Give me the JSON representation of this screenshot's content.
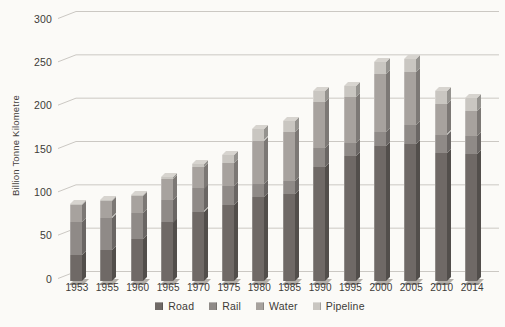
{
  "chart_data": {
    "type": "bar",
    "stacked": true,
    "style": "3d-column",
    "title": "",
    "ylabel": "Billion Tonne Kilometre",
    "xlabel": "",
    "ylim": [
      0,
      300
    ],
    "yticks": [
      0,
      50,
      100,
      150,
      200,
      250,
      300
    ],
    "grid": true,
    "legend_position": "bottom",
    "categories": [
      "1953",
      "1955",
      "1960",
      "1965",
      "1970",
      "1975",
      "1980",
      "1985",
      "1990",
      "1995",
      "2000",
      "2005",
      "2010",
      "2014"
    ],
    "series": [
      {
        "name": "Road",
        "color": "#6f6966",
        "values": [
          30,
          36,
          48,
          68,
          80,
          88,
          97,
          100,
          131,
          144,
          156,
          158,
          148,
          146
        ]
      },
      {
        "name": "Rail",
        "color": "#8f8a87",
        "values": [
          38,
          37,
          30,
          26,
          27,
          22,
          15,
          15,
          22,
          15,
          16,
          22,
          21,
          21
        ]
      },
      {
        "name": "Water",
        "color": "#a7a29e",
        "values": [
          20,
          19,
          20,
          24,
          25,
          26,
          50,
          57,
          53,
          53,
          67,
          61,
          35,
          29
        ]
      },
      {
        "name": "Pipeline",
        "color": "#c9c6c1",
        "values": [
          1,
          1,
          1,
          2,
          3,
          9,
          13,
          13,
          13,
          13,
          14,
          15,
          15,
          15
        ]
      }
    ],
    "totals": [
      89,
      93,
      99,
      120,
      135,
      145,
      175,
      185,
      219,
      225,
      253,
      256,
      219,
      211
    ],
    "colors": {
      "grid": "#cbc8c3",
      "background": "#fbfaf7",
      "text": "#3d3a38",
      "bar_top_face": "#d7d4cf"
    }
  }
}
